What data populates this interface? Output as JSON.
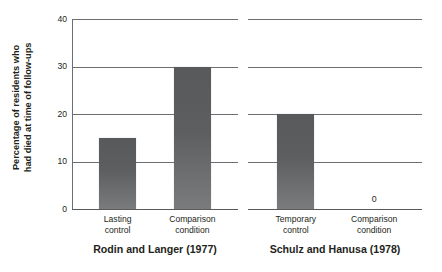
{
  "chart_data": {
    "type": "bar",
    "title": "",
    "xlabel": "",
    "ylabel_line1": "Percentage of residents who",
    "ylabel_line2": "had died at time of follow-ups",
    "ylim": [
      0,
      40
    ],
    "yticks": [
      "0",
      "10",
      "20",
      "30",
      "40"
    ],
    "ytick_values": [
      0,
      10,
      20,
      30,
      40
    ],
    "grid": true,
    "legend": "none",
    "panels": [
      {
        "title": "Rodin and Langer (1977)",
        "categories": [
          "Lasting control",
          "Comparison condition"
        ],
        "category_lines": [
          [
            "Lasting",
            "control"
          ],
          [
            "Comparison",
            "condition"
          ]
        ],
        "values": [
          15,
          30
        ],
        "value_labels": [
          "",
          ""
        ]
      },
      {
        "title": "Schulz and Hanusa (1978)",
        "categories": [
          "Temporary control",
          "Comparison condition"
        ],
        "category_lines": [
          [
            "Temporary",
            "control"
          ],
          [
            "Comparison",
            "condition"
          ]
        ],
        "values": [
          20,
          0
        ],
        "value_labels": [
          "",
          "0"
        ]
      }
    ],
    "colors": {
      "bar": "#5d5e60",
      "bar_top": "#58595b",
      "bar_bottom": "#7a7b7d",
      "gridline": "#6d6e71",
      "axis": "#58595b",
      "text": "#231f20",
      "background": "#ffffff"
    }
  }
}
